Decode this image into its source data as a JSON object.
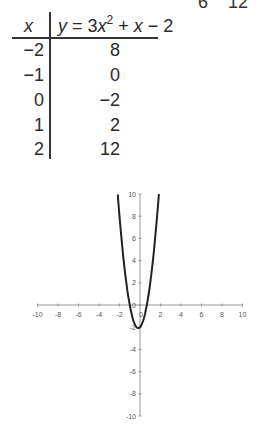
{
  "top_partial": {
    "left": "6",
    "right": "12"
  },
  "table": {
    "header_x": "x",
    "header_y_prefix": "y",
    "header_y_eq": " = 3",
    "header_y_x": "x",
    "header_y_exp": "2",
    "header_y_rest1": " + ",
    "header_y_x2": "x",
    "header_y_rest2": " − 2",
    "rows": [
      {
        "x": "−2",
        "y": "8"
      },
      {
        "x": "−1",
        "y": "0"
      },
      {
        "x": "0",
        "y": "−2"
      },
      {
        "x": "1",
        "y": "2"
      },
      {
        "x": "2",
        "y": "12"
      }
    ]
  },
  "chart_data": {
    "type": "line",
    "title": "",
    "function": "y = 3x^2 + x - 2",
    "xlabel": "",
    "ylabel": "",
    "xlim": [
      -10,
      10
    ],
    "ylim": [
      -10,
      10
    ],
    "x_ticks": [
      "-10",
      "-8",
      "-6",
      "-4",
      "-2",
      "0",
      "2",
      "4",
      "6",
      "8",
      "10"
    ],
    "y_ticks": [
      "10",
      "8",
      "6",
      "4",
      "2",
      "0",
      "-2",
      "-4",
      "-6",
      "-8",
      "-10"
    ],
    "grid": false,
    "series": [
      {
        "name": "y = 3x^2 + x - 2",
        "x": [
          -2.17,
          -2,
          -1.5,
          -1,
          -0.5,
          -0.17,
          0,
          0.5,
          1,
          1.5,
          1.84
        ],
        "y": [
          10,
          8,
          3.25,
          0,
          -1.75,
          -2.08,
          -2,
          -0.75,
          2,
          6.25,
          10
        ]
      }
    ]
  }
}
